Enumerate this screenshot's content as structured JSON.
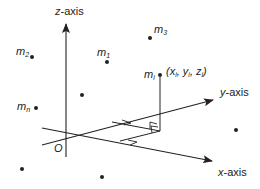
{
  "diagram": {
    "title": "",
    "type": "3d-coordinate-system-point-masses",
    "axes": {
      "z": {
        "label_var": "z",
        "label_rest": "-axis"
      },
      "y": {
        "label_var": "y",
        "label_rest": "-axis"
      },
      "x": {
        "label_var": "x",
        "label_rest": "-axis"
      }
    },
    "origin": {
      "label": "O"
    },
    "masses": [
      {
        "id": "m2",
        "base": "m",
        "sub": "2"
      },
      {
        "id": "m1",
        "base": "m",
        "sub": "1"
      },
      {
        "id": "m3",
        "base": "m",
        "sub": "3"
      },
      {
        "id": "mn",
        "base": "m",
        "sub": "n"
      },
      {
        "id": "mi",
        "base": "m",
        "sub": "i"
      }
    ],
    "point_coordinates": {
      "open": "(",
      "x": "x",
      "x_sub": "i",
      "sep1": ", ",
      "y": "y",
      "y_sub": "i",
      "sep2": ", ",
      "z": "z",
      "z_sub": "i",
      "close": ")"
    },
    "unlabeled_point_count": 4,
    "colors": {
      "ink": "#222222",
      "background": "#ffffff"
    }
  }
}
